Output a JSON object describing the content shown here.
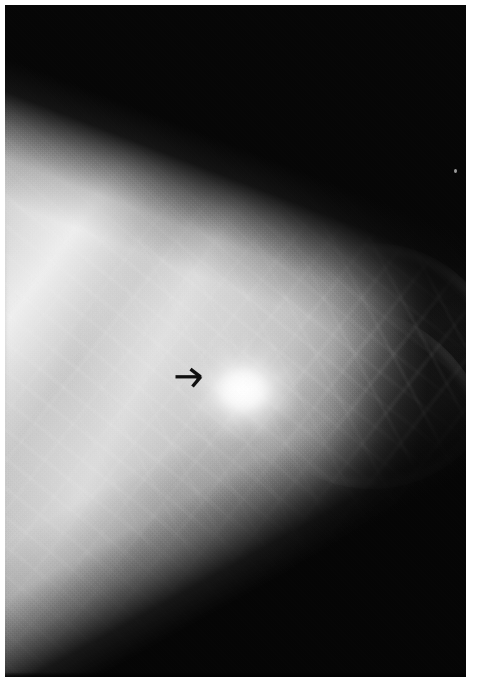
{
  "page": {
    "background_color": "#ffffff",
    "width": 478,
    "height": 699
  },
  "figure": {
    "type": "radiograph",
    "modality": "mammogram",
    "view": "mediolateral-oblique",
    "frame": {
      "left": 5,
      "top": 5,
      "width": 461,
      "height": 672,
      "border_color": "#ffffff"
    },
    "palette": {
      "film_black": "#060606",
      "background_dark": "#0a0a0a",
      "tissue_mid_gray": "#aeaeae",
      "tissue_light_gray": "#cacaca",
      "fibroglandular_bright": "#e8e8e8",
      "lesion_white": "#fdfdfd",
      "annotation_black": "#101010"
    },
    "regions": [
      {
        "name": "fibroglandular-tissue",
        "description": "Dense fibroglandular parenchyma occupying the left and central portion of the field",
        "tone": "#bdbdbd"
      },
      {
        "name": "fatty-background-upper-right",
        "description": "Radiolucent black background above the oblique skin line",
        "tone": "#0a0a0a"
      },
      {
        "name": "fatty-background-lower-right",
        "description": "Dark wedge below the inferior breast margin",
        "tone": "#050505"
      },
      {
        "name": "coopers-ligament-band",
        "description": "Bright oblique fibrous band running from upper-left toward the centre",
        "tone": "#f4f4f4"
      },
      {
        "name": "skin-line",
        "description": "Bright subcutaneous rim tracing the lateral breast margin",
        "tone": "#ececec"
      },
      {
        "name": "trabecular-striations",
        "description": "Fine linear trabecular and ductal markings radiating through the parenchyma",
        "tone": "#dadada"
      }
    ],
    "lesion": {
      "name": "spiculated-mass",
      "description": "Dense spiculated mass with ill-defined margins in the central breast",
      "center_x": 243,
      "center_y": 390,
      "width": 118,
      "height": 104,
      "tone": "#fdfdfd"
    },
    "annotation": {
      "name": "marker-arrow",
      "shape": "arrow",
      "direction": "right",
      "color": "#101010",
      "tail_x": 177,
      "tail_y": 377,
      "tip_x": 200,
      "tip_y": 377,
      "points_to": "spiculated-mass"
    },
    "artifact": {
      "name": "film-speck",
      "description": "Small bright dust speck in the dark background field",
      "x": 454,
      "y": 169
    }
  }
}
